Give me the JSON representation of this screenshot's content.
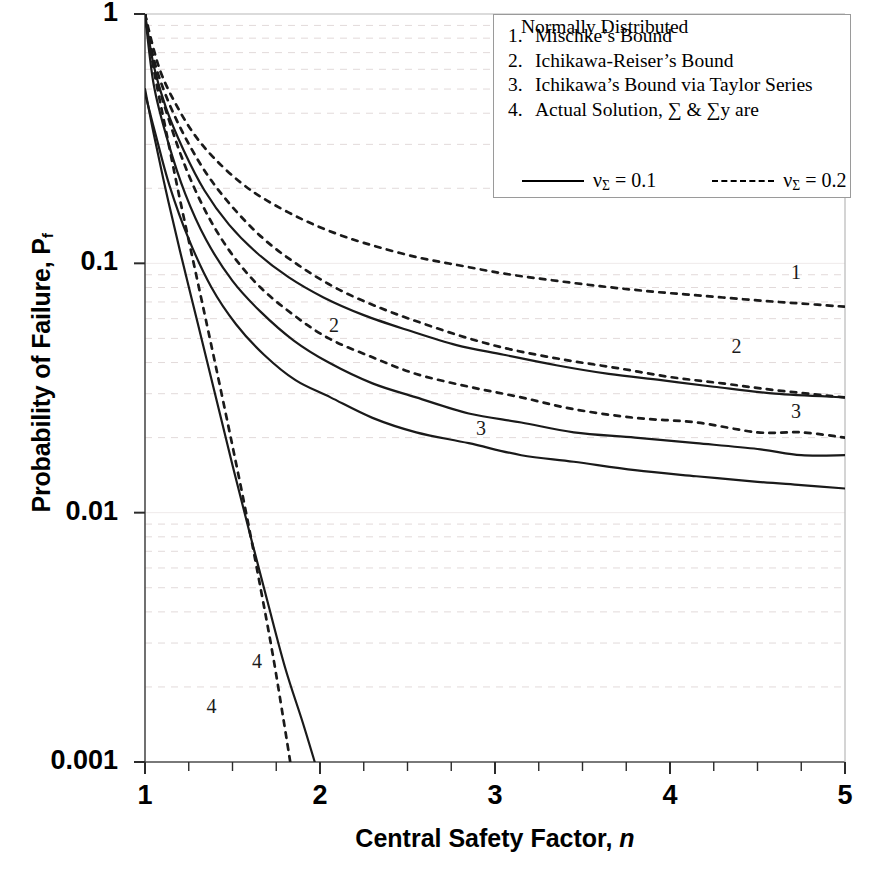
{
  "chart_data": {
    "type": "line",
    "title": "",
    "xlabel": "Central Safety Factor, n",
    "ylabel": "Probability of Failure, Pf",
    "xscale": "linear",
    "yscale": "log",
    "xlim": [
      1,
      5
    ],
    "ylim": [
      0.001,
      1
    ],
    "xticks": [
      "1",
      "2",
      "3",
      "4",
      "5"
    ],
    "xtick_values": [
      1,
      2,
      3,
      4,
      5
    ],
    "yticks": [
      "1",
      "0.1",
      "0.01",
      "0.001"
    ],
    "ytick_values": [
      1,
      0.1,
      0.01,
      0.001
    ],
    "x_minor_tick_step": 0.25,
    "grid": "minor-horizontal-dashed",
    "legend_position": "top-right",
    "series": [
      {
        "name": "Mischke's Bound, v_sigma = 0.2",
        "curve_number": "1",
        "style": "dashed",
        "points": [
          [
            1.0,
            1.0
          ],
          [
            1.05,
            0.72
          ],
          [
            1.1,
            0.56
          ],
          [
            1.18,
            0.43
          ],
          [
            1.28,
            0.33
          ],
          [
            1.4,
            0.262
          ],
          [
            1.55,
            0.21
          ],
          [
            1.7,
            0.178
          ],
          [
            1.9,
            0.15
          ],
          [
            2.1,
            0.131
          ],
          [
            2.3,
            0.118
          ],
          [
            2.55,
            0.106
          ],
          [
            2.8,
            0.098
          ],
          [
            3.05,
            0.091
          ],
          [
            3.3,
            0.086
          ],
          [
            3.6,
            0.081
          ],
          [
            3.9,
            0.077
          ],
          [
            4.2,
            0.074
          ],
          [
            4.5,
            0.071
          ],
          [
            4.75,
            0.069
          ],
          [
            5.0,
            0.067
          ]
        ]
      },
      {
        "name": "Ichikawa-Reiser's Bound, v_sigma = 0.2",
        "curve_number": "2",
        "style": "dashed",
        "points": [
          [
            1.0,
            1.0
          ],
          [
            1.05,
            0.66
          ],
          [
            1.12,
            0.47
          ],
          [
            1.22,
            0.33
          ],
          [
            1.35,
            0.23
          ],
          [
            1.5,
            0.168
          ],
          [
            1.68,
            0.125
          ],
          [
            1.88,
            0.098
          ],
          [
            2.1,
            0.079
          ],
          [
            2.35,
            0.066
          ],
          [
            2.6,
            0.057
          ],
          [
            2.85,
            0.05
          ],
          [
            3.1,
            0.045
          ],
          [
            3.4,
            0.041
          ],
          [
            3.7,
            0.038
          ],
          [
            4.0,
            0.035
          ],
          [
            4.3,
            0.033
          ],
          [
            4.6,
            0.031
          ],
          [
            5.0,
            0.029
          ]
        ]
      },
      {
        "name": "Ichikawa's Bound via Taylor Series, v_sigma = 0.2",
        "curve_number": "3",
        "style": "dashed",
        "points": [
          [
            1.0,
            1.0
          ],
          [
            1.06,
            0.58
          ],
          [
            1.14,
            0.37
          ],
          [
            1.24,
            0.235
          ],
          [
            1.36,
            0.155
          ],
          [
            1.5,
            0.108
          ],
          [
            1.66,
            0.08
          ],
          [
            1.85,
            0.062
          ],
          [
            2.05,
            0.05
          ],
          [
            2.3,
            0.042
          ],
          [
            2.55,
            0.036
          ],
          [
            2.85,
            0.032
          ],
          [
            3.15,
            0.029
          ],
          [
            3.45,
            0.026
          ],
          [
            3.8,
            0.024
          ],
          [
            4.15,
            0.023
          ],
          [
            4.5,
            0.021
          ],
          [
            4.75,
            0.021
          ],
          [
            5.0,
            0.02
          ]
        ]
      },
      {
        "name": "Mischke's Bound, v_sigma = 0.1",
        "curve_number": "2",
        "style": "solid",
        "points": [
          [
            1.0,
            1.0
          ],
          [
            1.05,
            0.62
          ],
          [
            1.12,
            0.42
          ],
          [
            1.22,
            0.285
          ],
          [
            1.34,
            0.196
          ],
          [
            1.48,
            0.143
          ],
          [
            1.64,
            0.11
          ],
          [
            1.82,
            0.088
          ],
          [
            2.02,
            0.073
          ],
          [
            2.25,
            0.062
          ],
          [
            2.5,
            0.054
          ],
          [
            2.78,
            0.047
          ],
          [
            3.05,
            0.043
          ],
          [
            3.35,
            0.039
          ],
          [
            3.65,
            0.036
          ],
          [
            3.95,
            0.034
          ],
          [
            4.25,
            0.032
          ],
          [
            4.6,
            0.03
          ],
          [
            5.0,
            0.029
          ]
        ]
      },
      {
        "name": "Ichikawa-Reiser's Bound, v_sigma = 0.1",
        "curve_number": "3",
        "style": "solid",
        "points": [
          [
            1.0,
            1.0
          ],
          [
            1.05,
            0.52
          ],
          [
            1.13,
            0.31
          ],
          [
            1.23,
            0.19
          ],
          [
            1.35,
            0.124
          ],
          [
            1.5,
            0.085
          ],
          [
            1.66,
            0.064
          ],
          [
            1.85,
            0.049
          ],
          [
            2.05,
            0.04
          ],
          [
            2.3,
            0.033
          ],
          [
            2.55,
            0.029
          ],
          [
            2.85,
            0.025
          ],
          [
            3.15,
            0.023
          ],
          [
            3.45,
            0.021
          ],
          [
            3.8,
            0.02
          ],
          [
            4.15,
            0.019
          ],
          [
            4.5,
            0.018
          ],
          [
            4.75,
            0.017
          ],
          [
            5.0,
            0.017
          ]
        ]
      },
      {
        "name": "Ichikawa's Bound via Taylor Series, v_sigma = 0.1",
        "curve_number": "3",
        "style": "solid",
        "points": [
          [
            1.0,
            0.48
          ],
          [
            1.06,
            0.33
          ],
          [
            1.14,
            0.205
          ],
          [
            1.25,
            0.125
          ],
          [
            1.38,
            0.08
          ],
          [
            1.52,
            0.057
          ],
          [
            1.68,
            0.043
          ],
          [
            1.86,
            0.034
          ],
          [
            2.06,
            0.029
          ],
          [
            2.3,
            0.024
          ],
          [
            2.55,
            0.021
          ],
          [
            2.85,
            0.019
          ],
          [
            3.15,
            0.017
          ],
          [
            3.45,
            0.016
          ],
          [
            3.8,
            0.0148
          ],
          [
            4.15,
            0.014
          ],
          [
            4.5,
            0.0133
          ],
          [
            4.75,
            0.0129
          ],
          [
            5.0,
            0.0125
          ]
        ]
      },
      {
        "name": "Actual Solution, v_sigma = 0.1",
        "curve_number": "4",
        "style": "solid",
        "points": [
          [
            1.0,
            0.5
          ],
          [
            1.05,
            0.33
          ],
          [
            1.12,
            0.195
          ],
          [
            1.2,
            0.112
          ],
          [
            1.3,
            0.058
          ],
          [
            1.4,
            0.03
          ],
          [
            1.5,
            0.0155
          ],
          [
            1.6,
            0.0082
          ],
          [
            1.7,
            0.0044
          ],
          [
            1.8,
            0.0024
          ],
          [
            1.9,
            0.00145
          ],
          [
            1.97,
            0.001
          ]
        ]
      },
      {
        "name": "Actual Solution, v_sigma = 0.2",
        "curve_number": "4",
        "style": "dashed",
        "points": [
          [
            1.0,
            1.0
          ],
          [
            1.05,
            0.6
          ],
          [
            1.12,
            0.34
          ],
          [
            1.2,
            0.18
          ],
          [
            1.3,
            0.085
          ],
          [
            1.4,
            0.04
          ],
          [
            1.5,
            0.0185
          ],
          [
            1.58,
            0.0098
          ],
          [
            1.66,
            0.005
          ],
          [
            1.73,
            0.0027
          ],
          [
            1.79,
            0.0015
          ],
          [
            1.83,
            0.001
          ]
        ]
      }
    ],
    "curve_annotations": [
      {
        "label": "1",
        "x": 4.72,
        "y": 0.092
      },
      {
        "label": "2",
        "x": 2.08,
        "y": 0.0565
      },
      {
        "label": "2",
        "x": 4.38,
        "y": 0.0465
      },
      {
        "label": "3",
        "x": 2.92,
        "y": 0.0218
      },
      {
        "label": "3",
        "x": 4.72,
        "y": 0.0255
      },
      {
        "label": "4",
        "x": 1.64,
        "y": 0.00255
      },
      {
        "label": "4",
        "x": 1.38,
        "y": 0.00167
      }
    ]
  },
  "legend": {
    "items": [
      {
        "number": "1.",
        "text": "Mischke’s Bound"
      },
      {
        "number": "2.",
        "text": "Ichikawa-Reiser’s Bound"
      },
      {
        "number": "3.",
        "text": "Ichikawa’s Bound via Taylor Series"
      },
      {
        "number": "4.",
        "text": "Actual Solution, ∑ & ∑y are"
      }
    ],
    "item4_continuation": "Normally Distributed",
    "key": {
      "solid_label_prefix": "ν",
      "solid_label_sub": "Σ",
      "solid_label_suffix": " = 0.1",
      "dashed_label_prefix": "ν",
      "dashed_label_sub": "Σ",
      "dashed_label_suffix": " = 0.2"
    }
  },
  "axes": {
    "ylabel_text": "Probability of Failure, P",
    "ylabel_sub": "f",
    "xlabel_text": "Central Safety Factor, ",
    "xlabel_italic": "n"
  },
  "colors": {
    "curve": "#1a1a1a",
    "axis": "#4d4d4d",
    "grid_minor": "#e2dada",
    "legend_border": "#9a9a9a",
    "background": "#ffffff"
  }
}
